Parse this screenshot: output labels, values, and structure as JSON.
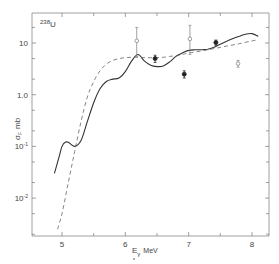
{
  "chart_data": {
    "type": "line",
    "title": "",
    "annotation": {
      "isotope_mass": "238",
      "isotope_symbol": "U"
    },
    "xlabel": "E_γ MeV",
    "xlabel_parts": {
      "symbol": "E",
      "subscript": "γ",
      "unit": "MeV"
    },
    "ylabel": "σ_F mb",
    "ylabel_parts": {
      "symbol": "σ",
      "subscript": "F",
      "unit": "mb"
    },
    "xlim": [
      4.5,
      8.25
    ],
    "ylim_log": [
      0.0017,
      38
    ],
    "yscale": "log",
    "grid": false,
    "x_ticks": [
      5,
      6,
      7,
      8
    ],
    "x_tick_labels": [
      "5",
      "6",
      "7",
      "8"
    ],
    "y_ticks": [
      10,
      1.0,
      0.1,
      0.01
    ],
    "y_tick_labels": [
      {
        "base": "10",
        "exp": ""
      },
      {
        "base": "1.0",
        "exp": ""
      },
      {
        "base": "10",
        "exp": "-1"
      },
      {
        "base": "10",
        "exp": "-2"
      }
    ],
    "series": [
      {
        "name": "calculated (solid)",
        "style": "solid",
        "x": [
          4.88,
          4.95,
          5.0,
          5.05,
          5.1,
          5.2,
          5.3,
          5.4,
          5.5,
          5.6,
          5.7,
          5.8,
          5.9,
          6.0,
          6.1,
          6.2,
          6.3,
          6.4,
          6.5,
          6.6,
          6.7,
          6.8,
          6.9,
          7.0,
          7.1,
          7.2,
          7.3,
          7.4,
          7.5,
          7.6,
          7.7,
          7.8,
          7.9,
          8.0,
          8.1
        ],
        "y": [
          0.03,
          0.06,
          0.1,
          0.12,
          0.12,
          0.1,
          0.13,
          0.3,
          0.7,
          1.3,
          1.8,
          2.0,
          2.1,
          2.8,
          4.5,
          6.0,
          4.5,
          3.7,
          3.5,
          3.6,
          4.3,
          5.5,
          6.4,
          7.2,
          7.4,
          7.4,
          7.6,
          8.3,
          9.5,
          10.8,
          12.2,
          13.5,
          14.8,
          15.2,
          13.5
        ]
      },
      {
        "name": "calculated (dashed)",
        "style": "dashed",
        "x": [
          4.93,
          5.0,
          5.1,
          5.2,
          5.3,
          5.4,
          5.5,
          5.6,
          5.7,
          5.8,
          5.9,
          6.0,
          6.1,
          6.2,
          6.3,
          6.4,
          6.5,
          6.6,
          6.7,
          6.8,
          6.9,
          7.0,
          7.2,
          7.4,
          7.6,
          7.8,
          8.0,
          8.1
        ],
        "y": [
          0.0025,
          0.005,
          0.02,
          0.08,
          0.3,
          0.9,
          1.8,
          2.9,
          3.9,
          4.6,
          5.0,
          5.2,
          5.3,
          5.3,
          5.2,
          5.2,
          5.2,
          5.3,
          5.5,
          5.7,
          6.0,
          6.4,
          7.0,
          7.8,
          8.7,
          9.7,
          11.0,
          11.6
        ]
      },
      {
        "name": "experimental (filled)",
        "style": "points-filled",
        "x": [
          6.47,
          6.93,
          7.43
        ],
        "y": [
          5.0,
          2.5,
          10.2
        ],
        "yerr_low": [
          0.8,
          0.4,
          1.2
        ],
        "yerr_high": [
          0.8,
          0.4,
          1.2
        ]
      },
      {
        "name": "experimental (open)",
        "style": "points-open",
        "x": [
          6.18,
          7.02,
          7.78
        ],
        "y": [
          11.0,
          12.0,
          4.0
        ],
        "yerr_low": [
          5.5,
          6.0,
          0.6
        ],
        "yerr_high": [
          9.0,
          10.0,
          0.6
        ]
      }
    ]
  }
}
